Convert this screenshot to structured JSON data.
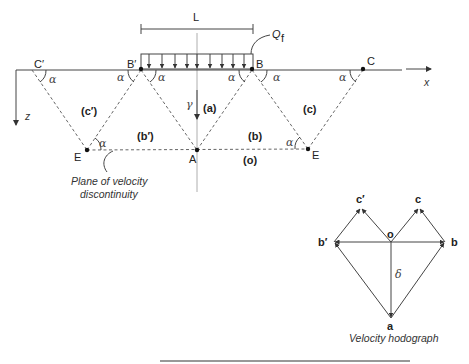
{
  "figure": {
    "load_width_label": "L",
    "load_label": "Q",
    "load_subscript": "f",
    "axis_x_label": "x",
    "axis_z_label": "z",
    "points": {
      "C_prime": "C′",
      "B_prime": "B′",
      "B": "B",
      "C": "C",
      "E_left": "E",
      "A": "A",
      "E_right": "E"
    },
    "angle_symbol": "α",
    "unit_weight_symbol": "γ",
    "regions": {
      "a": "(a)",
      "b": "(b)",
      "b_prime": "(b′)",
      "c": "(c)",
      "c_prime": "(c′)",
      "o": "(o)"
    },
    "annotation_line1": "Plane of velocity",
    "annotation_line2": "discontinuity"
  },
  "hodograph": {
    "title": "Velocity hodograph",
    "o": "o",
    "a": "a",
    "b": "b",
    "b_prime": "b′",
    "c": "c",
    "c_prime": "c′",
    "delta": "δ"
  }
}
